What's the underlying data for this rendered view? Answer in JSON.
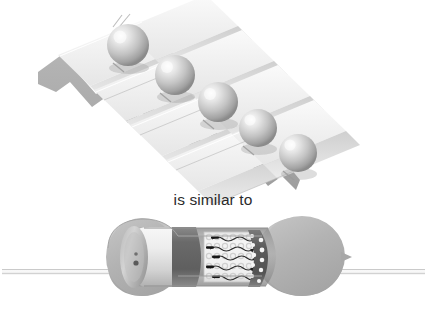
{
  "figure": {
    "title_text": "",
    "caption": "is similar to",
    "background_color": "#ffffff",
    "style": "grayscale textbook illustration",
    "panels": [
      {
        "name": "washboard-ramp-panel",
        "description": "Corrugated washboard-like inclined ramp with five spheres rolling down it",
        "label": "",
        "ball_count": 5,
        "ridge_count": 8,
        "colors": {
          "ramp_top": "#f2f2f2",
          "ramp_face": "#d8d8d8",
          "ramp_shadow": "#a9a9a9",
          "ramp_edge": "#8e8e8e",
          "sphere_light": "#fcfcfc",
          "sphere_mid": "#c9c9c9",
          "sphere_dark": "#8f8f8f"
        },
        "balls": [
          {
            "name": "ball-1",
            "cx": 128,
            "cy": 45,
            "r": 21
          },
          {
            "name": "ball-2",
            "cx": 175,
            "cy": 75,
            "r": 20
          },
          {
            "name": "ball-3",
            "cx": 218,
            "cy": 102,
            "r": 20
          },
          {
            "name": "ball-4",
            "cx": 258,
            "cy": 128,
            "r": 19
          },
          {
            "name": "ball-5",
            "cx": 298,
            "cy": 153,
            "r": 19
          }
        ]
      },
      {
        "name": "resistor-cutaway-panel",
        "description": "Cutaway side view of a carbon composition resistor showing leads, end caps and electron paths through the resistive element",
        "label": "",
        "colors": {
          "body_light": "#c6c6c6",
          "body_mid": "#b0b0b0",
          "body_dark": "#9a9a9a",
          "cap_light": "#ededed",
          "cap_shadow": "#9c9c9c",
          "dark_band": "#6f6f6f",
          "core_bg": "#efefef",
          "lead_fill": "#fbfbfb",
          "lead_edge": "#c8c8c8",
          "electron_dash": "#1a1a1a",
          "atom_ring": "#d6d6d6"
        },
        "parts": [
          {
            "name": "left-lead-wire",
            "label": "lead wire"
          },
          {
            "name": "right-lead-wire",
            "label": "lead wire"
          },
          {
            "name": "left-end-cap",
            "label": "end cap"
          },
          {
            "name": "left-dark-band",
            "label": "colour band"
          },
          {
            "name": "resistive-core",
            "label": "resistive element"
          },
          {
            "name": "right-dark-band-dots",
            "label": "colour band"
          },
          {
            "name": "right-body-bulb",
            "label": "body"
          }
        ],
        "electron_paths": 5,
        "electron_dashes": 5,
        "atom_circles": 36
      }
    ]
  }
}
